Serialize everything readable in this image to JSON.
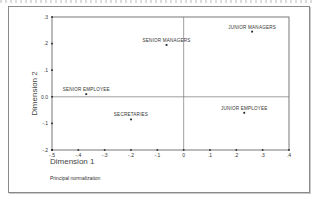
{
  "chart_data": {
    "type": "scatter",
    "title": "",
    "xlabel": "Dimension 1",
    "ylabel": "Dimension 2",
    "note": "Principal normalization",
    "xlim": [
      -0.5,
      0.4
    ],
    "ylim": [
      -0.2,
      0.3
    ],
    "x_ticks": [
      "-.5",
      "-.4",
      "-.3",
      "-.2",
      "-.1",
      "0",
      ".1",
      ".2",
      ".3",
      ".4"
    ],
    "y_ticks": [
      ".3",
      ".2",
      ".1",
      "0.0",
      "-.1",
      "-.2"
    ],
    "reference_lines": {
      "x": 0,
      "y": 0
    },
    "grid": false,
    "legend": null,
    "points": [
      {
        "label": "SENIOR MANAGERS",
        "x": -0.065,
        "y": 0.195
      },
      {
        "label": "JUNIOR MANAGERS",
        "x": 0.26,
        "y": 0.245
      },
      {
        "label": "SENIOR EMPLOYEE",
        "x": -0.37,
        "y": 0.01
      },
      {
        "label": "SECRETARIES",
        "x": -0.2,
        "y": -0.085
      },
      {
        "label": "JUNIOR EMPLOYEE",
        "x": 0.23,
        "y": -0.06
      }
    ]
  }
}
